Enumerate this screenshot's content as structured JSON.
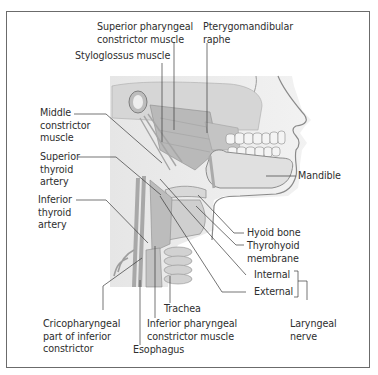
{
  "figure": {
    "labels": {
      "superior_pharyngeal": "Superior pharyngeal\nconstrictor muscle",
      "pterygomandibular": "Pterygomandibular\nraphe",
      "styloglossus": "Styloglossus muscle",
      "middle_constrictor": "Middle\nconstrictor\nmuscle",
      "superior_thyroid": "Superior\nthyroid\nartery",
      "inferior_thyroid": "Inferior\nthyroid\nartery",
      "mandible": "Mandible",
      "hyoid": "Hyoid bone",
      "thyrohyoid": "Thyrohyoid\nmembrane",
      "internal": "Internal",
      "external": "External",
      "laryngeal_nerve": "Laryngeal\nnerve",
      "trachea": "Trachea",
      "inferior_pharyngeal": "Inferior pharyngeal\nconstrictor muscle",
      "cricopharyngeal": "Cricopharyngeal\npart of inferior\nconstrictor",
      "esophagus": "Esophagus"
    },
    "colors": {
      "border": "#6b6b6b",
      "leader": "#3a3a3a",
      "tissue": "#c9c9c9",
      "tissue_dark": "#9a9a9a",
      "background": "#ffffff"
    }
  }
}
